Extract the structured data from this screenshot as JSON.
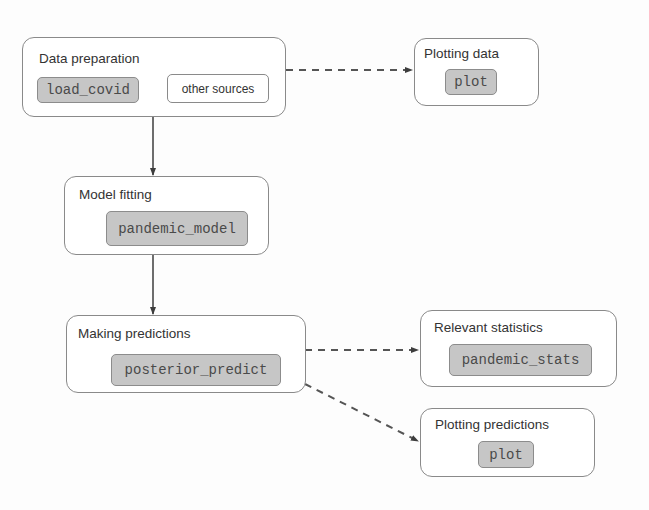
{
  "diagram": {
    "type": "workflow",
    "nodes": {
      "data_preparation": {
        "title": "Data preparation",
        "items": [
          {
            "label": "load_covid",
            "style": "code"
          },
          {
            "label": "other sources",
            "style": "plain"
          }
        ]
      },
      "plotting_data": {
        "title": "Plotting data",
        "items": [
          {
            "label": "plot",
            "style": "code"
          }
        ]
      },
      "model_fitting": {
        "title": "Model fitting",
        "items": [
          {
            "label": "pandemic_model",
            "style": "code"
          }
        ]
      },
      "making_predictions": {
        "title": "Making predictions",
        "items": [
          {
            "label": "posterior_predict",
            "style": "code"
          }
        ]
      },
      "relevant_statistics": {
        "title": "Relevant statistics",
        "items": [
          {
            "label": "pandemic_stats",
            "style": "code"
          }
        ]
      },
      "plotting_predictions": {
        "title": "Plotting predictions",
        "items": [
          {
            "label": "plot",
            "style": "code"
          }
        ]
      }
    },
    "edges": [
      {
        "from": "data_preparation",
        "to": "plotting_data",
        "style": "dashed"
      },
      {
        "from": "data_preparation",
        "to": "model_fitting",
        "style": "solid"
      },
      {
        "from": "model_fitting",
        "to": "making_predictions",
        "style": "solid"
      },
      {
        "from": "making_predictions",
        "to": "relevant_statistics",
        "style": "dashed"
      },
      {
        "from": "making_predictions",
        "to": "plotting_predictions",
        "style": "dashed"
      }
    ],
    "colors": {
      "code_chip_fill": "#c6c6c6",
      "border": "#8a8a8a",
      "edge": "#444444"
    }
  }
}
